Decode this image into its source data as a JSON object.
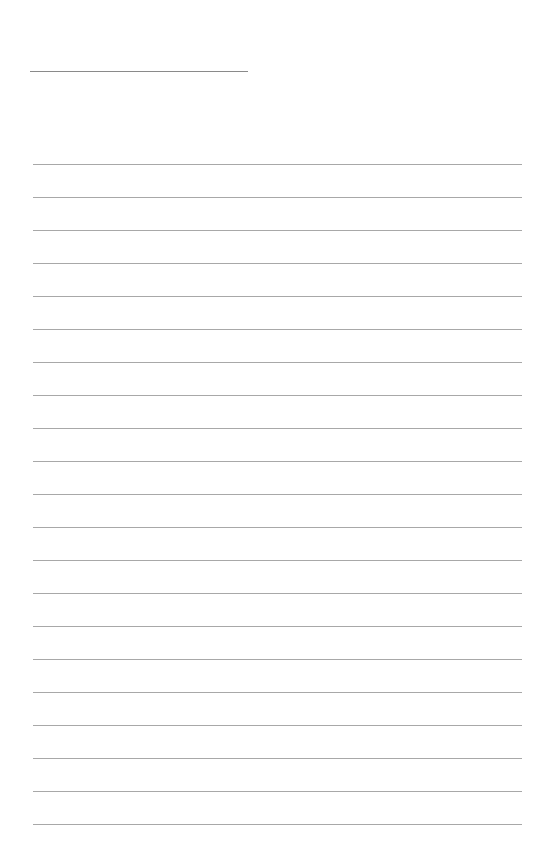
{
  "page": {
    "type": "blank-ruled-sheet",
    "background_color": "#ffffff",
    "line_color": "#a8a8a8",
    "title_line": {
      "top": 71,
      "left": 30,
      "width": 218
    },
    "rules": {
      "count": 21,
      "first_top": 164,
      "spacing": 33,
      "left": 33,
      "width": 489
    }
  }
}
